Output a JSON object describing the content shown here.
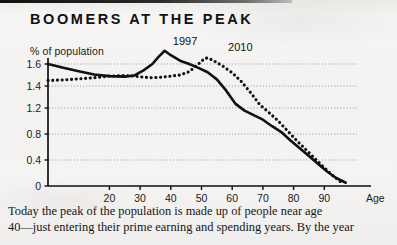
{
  "figure": {
    "title": "BOOMERS AT THE PEAK",
    "y_axis_caption": "% of population",
    "x_axis_caption": "Age"
  },
  "chart_data": {
    "type": "line",
    "title": "BOOMERS AT THE PEAK",
    "xlabel": "Age",
    "ylabel": "% of population",
    "xlim": [
      0,
      100
    ],
    "ylim": [
      0,
      1.8
    ],
    "grid": true,
    "grid_axis": "y",
    "legend": "inline-annotations",
    "xticks": [
      20,
      30,
      40,
      50,
      60,
      70,
      80,
      90
    ],
    "xtick_labels": [
      "20",
      "30",
      "40",
      "50",
      "60",
      "70",
      "80",
      "90"
    ],
    "yticks": [
      0,
      0.4,
      0.8,
      1.2,
      1.4,
      1.6
    ],
    "ytick_labels": [
      "0",
      "0.4",
      "0.8",
      "1.2",
      "1.4",
      "1.6"
    ],
    "annotations": [
      {
        "text": "1997",
        "x": 40,
        "y": 1.78
      },
      {
        "text": "2010",
        "x": 58,
        "y": 1.73
      }
    ],
    "series": [
      {
        "name": "1997",
        "style": "solid",
        "color": "#111111",
        "x": [
          0,
          5,
          10,
          15,
          20,
          25,
          28,
          31,
          34,
          36,
          38,
          40,
          43,
          46,
          49,
          52,
          55,
          58,
          61,
          64,
          67,
          70,
          73,
          76,
          79,
          82,
          85,
          88,
          91,
          94,
          97
        ],
        "y": [
          1.6,
          1.565,
          1.535,
          1.505,
          1.49,
          1.485,
          1.495,
          1.54,
          1.6,
          1.665,
          1.72,
          1.68,
          1.63,
          1.6,
          1.565,
          1.525,
          1.46,
          1.36,
          1.24,
          1.16,
          1.09,
          1.02,
          0.92,
          0.83,
          0.7,
          0.58,
          0.46,
          0.34,
          0.22,
          0.12,
          0.05
        ]
      },
      {
        "name": "2010",
        "style": "dotted",
        "color": "#111111",
        "x": [
          0,
          5,
          10,
          15,
          20,
          25,
          28,
          31,
          34,
          37,
          40,
          43,
          46,
          49,
          51,
          52,
          54,
          57,
          60,
          63,
          66,
          69,
          72,
          75,
          78,
          81,
          84,
          87,
          90,
          93,
          96
        ],
        "y": [
          1.45,
          1.455,
          1.465,
          1.475,
          1.49,
          1.495,
          1.49,
          1.48,
          1.475,
          1.48,
          1.49,
          1.5,
          1.53,
          1.6,
          1.65,
          1.655,
          1.63,
          1.58,
          1.52,
          1.44,
          1.34,
          1.23,
          1.13,
          1.0,
          0.85,
          0.7,
          0.56,
          0.42,
          0.28,
          0.15,
          0.04
        ]
      }
    ]
  },
  "caption": {
    "line1": "Today the peak of the population is made up of people near age",
    "line2": "40—just entering their prime earning and spending years. By the year"
  }
}
